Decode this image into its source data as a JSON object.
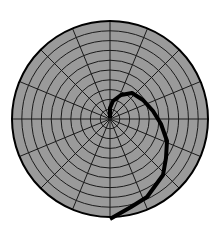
{
  "figure": {
    "type": "polar-grid-with-spiral",
    "center": [
      110,
      119
    ],
    "radius": 98,
    "ring_count": 10,
    "spoke_count": 16,
    "colors": {
      "background": "#ffffff",
      "fill": "#9a9a9a",
      "grid": "#1a1a1a",
      "outline": "#000000",
      "curve": "#000000"
    },
    "curve_points": [
      [
        110,
        118
      ],
      [
        110,
        108
      ],
      [
        113,
        101
      ],
      [
        121,
        95
      ],
      [
        132,
        93
      ],
      [
        143,
        100
      ],
      [
        153,
        111
      ],
      [
        161,
        124
      ],
      [
        167,
        141
      ],
      [
        166,
        158
      ],
      [
        163,
        175
      ],
      [
        147,
        197
      ],
      [
        131,
        207
      ],
      [
        110,
        219
      ]
    ],
    "curve_width": 4
  }
}
